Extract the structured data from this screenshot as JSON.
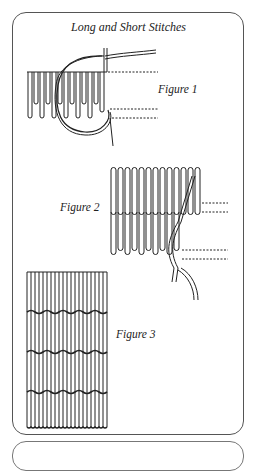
{
  "title": "Long and Short Stitches",
  "figures": [
    {
      "label": "Figure 1"
    },
    {
      "label": "Figure 2"
    },
    {
      "label": "Figure 3"
    }
  ],
  "colors": {
    "ink": "#222222",
    "border": "#555555",
    "background": "#ffffff"
  }
}
